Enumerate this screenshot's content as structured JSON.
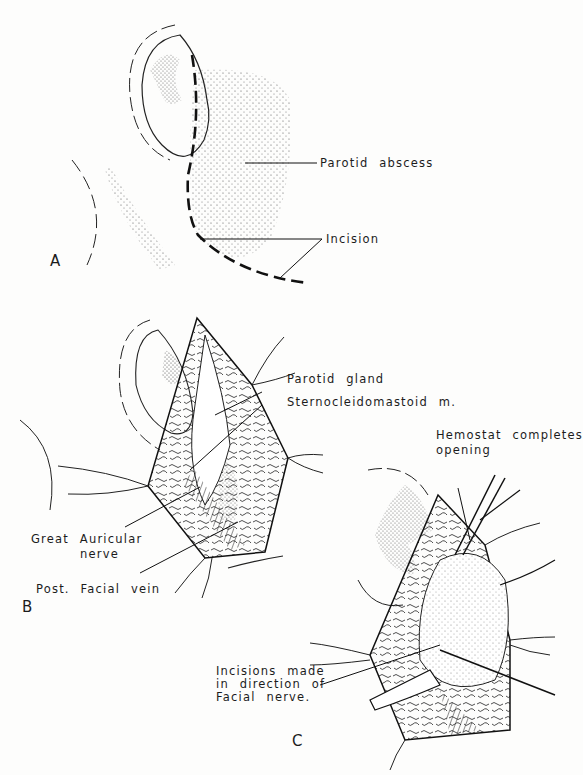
{
  "figure": {
    "panels": [
      {
        "id": "A",
        "letter": "A",
        "labels": {
          "parotid_abscess": "Parotid abscess",
          "incision": "Incision"
        }
      },
      {
        "id": "B",
        "letter": "B",
        "labels": {
          "parotid_gland": "Parotid gland",
          "sternocleidomastoid": "Sternocleidomastoid m.",
          "great_auricular_line1": "Great Auricular",
          "great_auricular_line2": "nerve",
          "post_facial_vein": "Post. Facial vein"
        }
      },
      {
        "id": "C",
        "letter": "C",
        "labels": {
          "hemostat_line1": "Hemostat completes",
          "hemostat_line2": "opening",
          "incisions_line1": "Incisions made",
          "incisions_line2": "in direction of",
          "incisions_line3": "Facial nerve."
        }
      }
    ],
    "signature": "Buchanan",
    "colors": {
      "ink": "#1c1c1c",
      "paper": "#fdfdfc",
      "stipple": "#555555"
    }
  }
}
